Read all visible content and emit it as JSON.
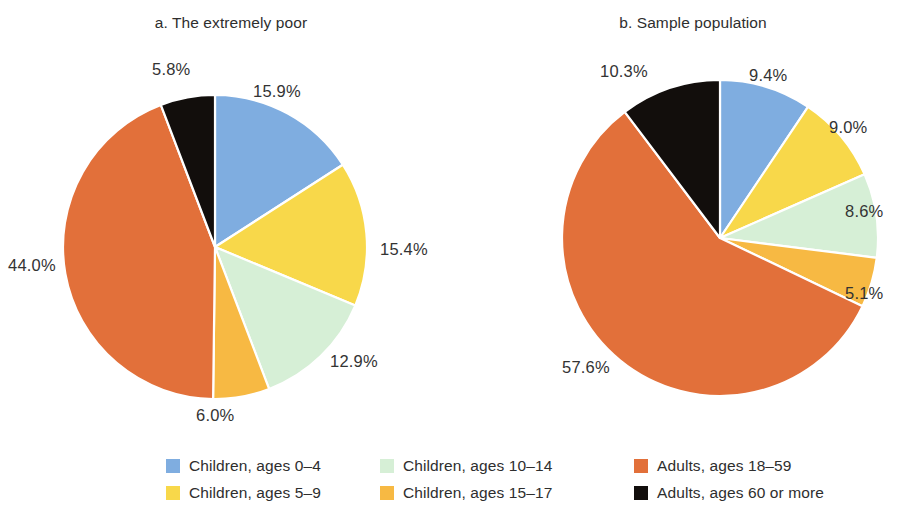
{
  "figure": {
    "background": "#ffffff",
    "panels": [
      {
        "id": "a",
        "title": "a. The extremely poor"
      },
      {
        "id": "b",
        "title": "b. Sample population"
      }
    ]
  },
  "legend": {
    "position": "bottom",
    "columns": 3,
    "items": [
      {
        "label": "Children, ages 0–4",
        "color": "#7FADE0",
        "swatch_name": "legend-swatch-children-0-4"
      },
      {
        "label": "Children, ages 5–9",
        "color": "#F8D84A",
        "swatch_name": "legend-swatch-children-5-9"
      },
      {
        "label": "Children, ages 10–14",
        "color": "#D6EFD6",
        "swatch_name": "legend-swatch-children-10-14"
      },
      {
        "label": "Children, ages 15–17",
        "color": "#F7B943",
        "swatch_name": "legend-swatch-children-15-17"
      },
      {
        "label": "Adults, ages 18–59",
        "color": "#E2703A",
        "swatch_name": "legend-swatch-adults-18-59"
      },
      {
        "label": "Adults, ages 60 or more",
        "color": "#120E0C",
        "swatch_name": "legend-swatch-adults-60-plus"
      }
    ]
  },
  "chart_data": [
    {
      "type": "pie",
      "panel": "a",
      "title": "a. The extremely poor",
      "categories": [
        "Children, ages 0–4",
        "Children, ages 5–9",
        "Children, ages 10–14",
        "Children, ages 15–17",
        "Adults, ages 18–59",
        "Adults, ages 60 or more"
      ],
      "values": [
        15.9,
        15.4,
        12.9,
        6.0,
        44.0,
        5.8
      ],
      "labels": [
        "15.9%",
        "15.4%",
        "12.9%",
        "6.0%",
        "44.0%",
        "5.8%"
      ],
      "colors": [
        "#7FADE0",
        "#F8D84A",
        "#D6EFD6",
        "#F7B943",
        "#E2703A",
        "#120E0C"
      ],
      "start_angle_deg": 0,
      "direction": "clockwise",
      "units": "percent",
      "legend": "shared-bottom"
    },
    {
      "type": "pie",
      "panel": "b",
      "title": "b. Sample population",
      "categories": [
        "Children, ages 0–4",
        "Children, ages 5–9",
        "Children, ages 10–14",
        "Children, ages 15–17",
        "Adults, ages 18–59",
        "Adults, ages 60 or more"
      ],
      "values": [
        9.4,
        9.0,
        8.6,
        5.1,
        57.6,
        10.3
      ],
      "labels": [
        "9.4%",
        "9.0%",
        "8.6%",
        "5.1%",
        "57.6%",
        "10.3%"
      ],
      "colors": [
        "#7FADE0",
        "#F8D84A",
        "#D6EFD6",
        "#F7B943",
        "#E2703A",
        "#120E0C"
      ],
      "start_angle_deg": 0,
      "direction": "clockwise",
      "units": "percent",
      "legend": "shared-bottom"
    }
  ],
  "label_positions": {
    "a": [
      {
        "text": "15.9%",
        "left": 253,
        "top": 82,
        "align": "left"
      },
      {
        "text": "15.4%",
        "left": 380,
        "top": 240,
        "align": "left"
      },
      {
        "text": "12.9%",
        "left": 330,
        "top": 352,
        "align": "left"
      },
      {
        "text": "6.0%",
        "left": 196,
        "top": 406,
        "align": "left"
      },
      {
        "text": "44.0%",
        "left": 8,
        "top": 256,
        "align": "left"
      },
      {
        "text": "5.8%",
        "left": 152,
        "top": 60,
        "align": "left"
      }
    ],
    "b": [
      {
        "text": "9.4%",
        "left": 749,
        "top": 66,
        "align": "left"
      },
      {
        "text": "9.0%",
        "left": 829,
        "top": 118,
        "align": "left"
      },
      {
        "text": "8.6%",
        "left": 845,
        "top": 202,
        "align": "left"
      },
      {
        "text": "5.1%",
        "left": 845,
        "top": 284,
        "align": "left"
      },
      {
        "text": "57.6%",
        "left": 562,
        "top": 358,
        "align": "left"
      },
      {
        "text": "10.3%",
        "left": 600,
        "top": 62,
        "align": "left"
      }
    ]
  },
  "geometry": {
    "a": {
      "cx": 215,
      "cy": 247,
      "r": 152
    },
    "b": {
      "cx": 720,
      "cy": 238,
      "r": 158
    }
  }
}
